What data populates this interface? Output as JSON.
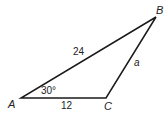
{
  "diagram": {
    "type": "triangle",
    "vertices": {
      "A": {
        "label": "A"
      },
      "B": {
        "label": "B"
      },
      "C": {
        "label": "C"
      }
    },
    "sides": {
      "AB": {
        "label": "24"
      },
      "AC": {
        "label": "12"
      },
      "BC": {
        "label": "a"
      }
    },
    "angles": {
      "A": {
        "label": "30°"
      }
    },
    "stroke_color": "#1a1a1a"
  }
}
